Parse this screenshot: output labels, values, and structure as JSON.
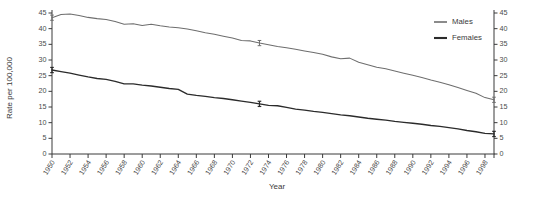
{
  "chart_data": {
    "type": "line",
    "title": "",
    "xlabel": "Year",
    "ylabel": "Rate per 100,000",
    "ylabel_right": "Rate per 100,000",
    "xlim": [
      1950,
      1999
    ],
    "ylim": [
      0,
      45
    ],
    "ytick_step": 5,
    "grid": false,
    "legend_position": "top-right",
    "yticks": [
      0,
      5,
      10,
      15,
      20,
      25,
      30,
      35,
      40,
      45
    ],
    "yticks_right": [
      0,
      5,
      10,
      15,
      20,
      25,
      30,
      35,
      40,
      45
    ],
    "xticks": [
      1950,
      1952,
      1954,
      1956,
      1958,
      1960,
      1962,
      1964,
      1966,
      1968,
      1970,
      1972,
      1974,
      1976,
      1978,
      1980,
      1982,
      1984,
      1986,
      1988,
      1990,
      1992,
      1994,
      1996,
      1998
    ],
    "xtick_labels": [
      "1950",
      "1952",
      "1954",
      "1956",
      "1958",
      "1960",
      "1962",
      "1964",
      "1966",
      "1968",
      "1970",
      "1972",
      "1974",
      "1976",
      "1978",
      "1980",
      "1982",
      "1984",
      "1986",
      "1988",
      "1990",
      "1992",
      "1994",
      "1996",
      "1998"
    ],
    "x": [
      1950,
      1951,
      1952,
      1953,
      1954,
      1955,
      1956,
      1957,
      1958,
      1959,
      1960,
      1961,
      1962,
      1963,
      1964,
      1965,
      1966,
      1967,
      1968,
      1969,
      1970,
      1971,
      1972,
      1973,
      1974,
      1975,
      1976,
      1977,
      1978,
      1979,
      1980,
      1981,
      1982,
      1983,
      1984,
      1985,
      1986,
      1987,
      1988,
      1989,
      1990,
      1991,
      1992,
      1993,
      1994,
      1995,
      1996,
      1997,
      1998,
      1999
    ],
    "series": [
      {
        "name": "Males",
        "color": "#6e6e6e",
        "values": [
          43.5,
          44.5,
          44.7,
          44.2,
          43.6,
          43.2,
          42.9,
          42.3,
          41.4,
          41.6,
          41.0,
          41.4,
          40.9,
          40.5,
          40.3,
          39.9,
          39.3,
          38.7,
          38.2,
          37.6,
          37.0,
          36.2,
          36.1,
          35.4,
          34.9,
          34.3,
          33.9,
          33.4,
          32.9,
          32.4,
          31.8,
          31.0,
          30.4,
          30.6,
          29.3,
          28.5,
          27.7,
          27.2,
          26.5,
          25.8,
          25.1,
          24.4,
          23.6,
          22.9,
          22.1,
          21.2,
          20.3,
          19.4,
          18.0,
          17.3
        ]
      },
      {
        "name": "Females",
        "color": "#2b2b2b",
        "values": [
          26.8,
          26.3,
          25.8,
          25.2,
          24.6,
          24.1,
          23.8,
          23.2,
          22.4,
          22.4,
          22.0,
          21.7,
          21.3,
          20.9,
          20.6,
          19.1,
          18.7,
          18.4,
          18.0,
          17.7,
          17.3,
          16.9,
          16.5,
          16.0,
          15.5,
          15.4,
          14.9,
          14.3,
          14.0,
          13.6,
          13.3,
          12.9,
          12.5,
          12.2,
          11.8,
          11.4,
          11.1,
          10.8,
          10.4,
          10.1,
          9.8,
          9.5,
          9.1,
          8.8,
          8.4,
          8.0,
          7.5,
          7.1,
          6.6,
          6.4
        ]
      }
    ],
    "error_bar_years": [
      1950,
      1973,
      1999
    ],
    "annotations": []
  },
  "legend": {
    "items": [
      {
        "label": "Males",
        "icon": "line-swatch-icon"
      },
      {
        "label": "Females",
        "icon": "line-swatch-icon"
      }
    ]
  }
}
